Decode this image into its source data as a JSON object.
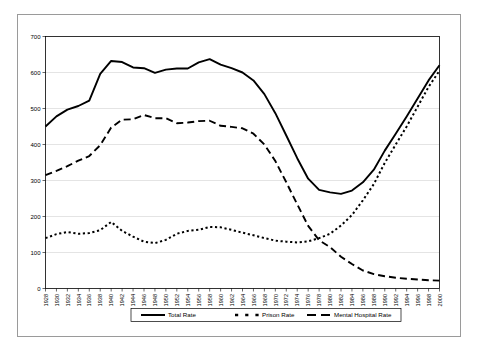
{
  "chart_data": {
    "type": "line",
    "title": "",
    "subtitle": "",
    "xlabel": "",
    "ylabel": "",
    "xlim": [
      1928,
      2000
    ],
    "ylim": [
      0,
      700
    ],
    "yticks": [
      0,
      100,
      200,
      300,
      400,
      500,
      600,
      700
    ],
    "grid": true,
    "legend_position": "bottom-center",
    "x": [
      1928,
      1930,
      1932,
      1934,
      1936,
      1938,
      1940,
      1942,
      1944,
      1946,
      1948,
      1950,
      1952,
      1954,
      1956,
      1958,
      1960,
      1962,
      1964,
      1966,
      1968,
      1970,
      1972,
      1974,
      1976,
      1978,
      1980,
      1982,
      1984,
      1986,
      1988,
      1990,
      1992,
      1994,
      1996,
      1998,
      2000
    ],
    "categories": [
      "1928",
      "1930",
      "1932",
      "1934",
      "1936",
      "1938",
      "1940",
      "1942",
      "1944",
      "1946",
      "1948",
      "1950",
      "1952",
      "1954",
      "1956",
      "1958",
      "1960",
      "1962",
      "1964",
      "1966",
      "1968",
      "1970",
      "1972",
      "1974",
      "1976",
      "1978",
      "1980",
      "1982",
      "1984",
      "1986",
      "1988",
      "1990",
      "1992",
      "1994",
      "1996",
      "1998",
      "2000"
    ],
    "series": [
      {
        "name": "Total Rate",
        "style": "solid",
        "color": "#000000",
        "values": [
          450,
          478,
          497,
          507,
          522,
          596,
          632,
          629,
          614,
          612,
          599,
          608,
          611,
          611,
          628,
          637,
          622,
          612,
          600,
          578,
          540,
          487,
          425,
          362,
          305,
          274,
          267,
          263,
          272,
          295,
          330,
          383,
          430,
          478,
          528,
          578,
          620
        ]
      },
      {
        "name": "Prison Rate",
        "style": "dotted",
        "color": "#000000",
        "values": [
          140,
          151,
          157,
          152,
          154,
          162,
          185,
          160,
          144,
          130,
          126,
          135,
          152,
          160,
          163,
          171,
          170,
          163,
          155,
          148,
          140,
          133,
          130,
          128,
          131,
          140,
          152,
          175,
          204,
          245,
          290,
          349,
          400,
          450,
          505,
          560,
          605
        ]
      },
      {
        "name": "Mental Hospital Rate",
        "style": "dashed",
        "color": "#000000",
        "values": [
          315,
          327,
          340,
          355,
          368,
          398,
          447,
          469,
          470,
          482,
          473,
          473,
          459,
          461,
          465,
          466,
          452,
          449,
          445,
          430,
          400,
          354,
          295,
          234,
          174,
          134,
          115,
          88,
          68,
          50,
          40,
          34,
          30,
          27,
          25,
          23,
          22
        ]
      }
    ]
  },
  "legend": {
    "entries": [
      {
        "label": "Total Rate",
        "style": "solid"
      },
      {
        "label": "Prison Rate",
        "style": "dotted"
      },
      {
        "label": "Mental Hospital Rate",
        "style": "dashed"
      }
    ]
  }
}
